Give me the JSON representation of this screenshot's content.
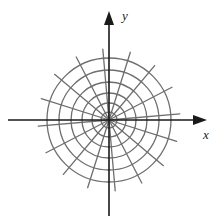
{
  "figure": {
    "kind": "polar-grid-diagram",
    "background_color": "#ffffff",
    "width": 220,
    "height": 224
  },
  "axes": {
    "color": "#1a1a1a",
    "stroke_width": 1.6,
    "origin": {
      "x": 109,
      "y": 120
    },
    "x_axis": {
      "label": "x",
      "start": {
        "x": 8,
        "y": 120
      },
      "end": {
        "x": 200,
        "y": 120
      },
      "arrow": "right",
      "label_position": {
        "x": 203,
        "y": 128
      }
    },
    "y_axis": {
      "label": "y",
      "start": {
        "x": 109,
        "y": 216
      },
      "end": {
        "x": 109,
        "y": 18
      },
      "arrow": "up",
      "label_position": {
        "x": 122,
        "y": 9
      }
    }
  },
  "polar_grid": {
    "color": "#6e6e6e",
    "stroke_width": 1.3,
    "center": {
      "x": 109,
      "y": 120
    },
    "circle_radii": [
      8,
      17,
      27,
      38,
      50,
      62
    ],
    "circle_count": 6,
    "spoke_count": 16,
    "spoke_angle_step_degrees": 22.5,
    "spoke_rotation_offset_degrees": 5,
    "spoke_inner_radius": 0,
    "spoke_outer_radius": 71
  },
  "chart_data": {
    "type": "scatter",
    "title": "",
    "xlabel": "x",
    "ylabel": "y",
    "x": [],
    "y": [],
    "grid": true,
    "legend": null
  }
}
